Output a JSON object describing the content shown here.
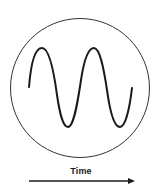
{
  "diagram": {
    "title": "",
    "axis_label": "Time",
    "axis_direction": "right-arrow",
    "elements": [
      {
        "type": "circle",
        "label": "enclosing-circle"
      },
      {
        "type": "sine-wave",
        "label": "waveform",
        "cycles_visible": 2,
        "start_phase": "zero-crossing-rising"
      }
    ],
    "colors": {
      "stroke": "#1a1a1a",
      "circle_stroke": "#333333",
      "background": "#ffffff"
    }
  }
}
